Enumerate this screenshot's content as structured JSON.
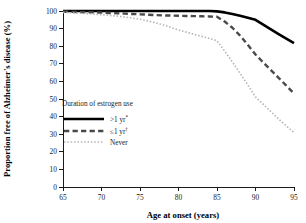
{
  "chart_data": {
    "type": "line",
    "title": "",
    "xlabel": "Age at onset (years)",
    "ylabel": "Proportion free of Alzheimer's disease (%)",
    "xlim": [
      65,
      95
    ],
    "ylim": [
      0,
      100
    ],
    "grid": false,
    "legend_position": "inside-left",
    "legend_title": "Duration of estrogen use",
    "xticks": [
      65,
      70,
      75,
      80,
      85,
      90,
      95
    ],
    "yticks": [
      0,
      10,
      20,
      30,
      40,
      50,
      60,
      70,
      80,
      90,
      100
    ],
    "xtick_labels": [
      "65",
      "70",
      "75",
      "80",
      "85",
      "90",
      "95"
    ],
    "ytick_labels": [
      "0",
      "10",
      "20",
      "30",
      "40",
      "50",
      "60",
      "70",
      "80",
      "90",
      "100"
    ],
    "x": [
      65,
      66,
      67,
      68,
      69,
      70,
      71,
      72,
      73,
      74,
      75,
      76,
      77,
      78,
      79,
      80,
      81,
      82,
      83,
      84,
      85,
      86,
      87,
      88,
      89,
      90,
      91,
      92,
      93,
      94,
      95
    ],
    "series": [
      {
        "name": ">1 yr*",
        "label": ">1 yr",
        "marker": "*",
        "style": "solid",
        "color": "#000000",
        "width": 2.6,
        "values": [
          100,
          100,
          100,
          100,
          100,
          100,
          100,
          100,
          100,
          100,
          100,
          100,
          100,
          100,
          100,
          100,
          100,
          100,
          100,
          100,
          99.8,
          99.2,
          98.3,
          97.3,
          96.2,
          95.0,
          92.3,
          89.6,
          86.9,
          84.3,
          81.8
        ]
      },
      {
        "name": "<1 yr†",
        "label": "≤1 yr",
        "marker": "†",
        "style": "dashed",
        "color": "#4a4a4a",
        "width": 2.4,
        "values": [
          99.6,
          99.5,
          99.4,
          99.3,
          99.2,
          99.1,
          98.9,
          98.7,
          98.5,
          98.3,
          98.1,
          97.9,
          97.7,
          97.5,
          97.4,
          97.3,
          97.2,
          97.1,
          97.0,
          96.9,
          96.7,
          94.0,
          90.5,
          86.0,
          80.8,
          75.3,
          70.8,
          66.4,
          62.0,
          57.6,
          53.2
        ]
      },
      {
        "name": "Never",
        "label": "Never",
        "marker": "",
        "style": "dotted",
        "color": "#b5b5b5",
        "width": 1.6,
        "values": [
          99.2,
          99.0,
          98.8,
          98.5,
          98.2,
          97.9,
          97.5,
          97.1,
          96.6,
          96.0,
          95.3,
          94.4,
          93.3,
          92.1,
          90.7,
          89.2,
          88.0,
          86.8,
          85.6,
          84.4,
          83.1,
          77.2,
          71.0,
          64.6,
          58.0,
          51.2,
          47.0,
          42.8,
          38.6,
          34.7,
          31.0
        ]
      }
    ]
  }
}
